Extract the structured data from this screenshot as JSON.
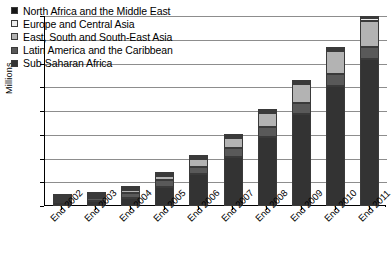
{
  "chart_data": {
    "type": "bar",
    "stacked": true,
    "title": "",
    "xlabel": "",
    "ylabel": "Millions",
    "ylim": [
      0.0,
      8.0
    ],
    "ytick_labels": [
      "0.0",
      "1.0",
      "2.0",
      "3.0",
      "4.0",
      "5.0",
      "6.0",
      "7.0",
      "8.0"
    ],
    "ytick_values": [
      0.0,
      1.0,
      2.0,
      3.0,
      4.0,
      5.0,
      6.0,
      7.0,
      8.0
    ],
    "grid": "horizontal",
    "legend_position": "upper-left-inside",
    "categories": [
      "End 2002",
      "End 2003",
      "End 2004",
      "End 2005",
      "End 2006",
      "End 2007",
      "End 2008",
      "End 2009",
      "End 2010",
      "End 2011"
    ],
    "series": [
      {
        "name": "Sub-Saharan Africa",
        "color": "#333333",
        "values": [
          0.15,
          0.2,
          0.32,
          0.81,
          1.34,
          2.07,
          2.92,
          3.89,
          5.06,
          6.17
        ]
      },
      {
        "name": "Latin America and the Caribbean",
        "color": "#595959",
        "values": [
          0.12,
          0.14,
          0.22,
          0.28,
          0.32,
          0.37,
          0.42,
          0.46,
          0.5,
          0.54
        ]
      },
      {
        "name": "East, South and South-East Asia",
        "color": "#b3b3b3",
        "values": [
          0.04,
          0.06,
          0.13,
          0.18,
          0.31,
          0.43,
          0.59,
          0.78,
          0.95,
          1.08
        ]
      },
      {
        "name": "Europe and Central Asia",
        "color": "#ededed",
        "values": [
          0.01,
          0.01,
          0.02,
          0.03,
          0.04,
          0.05,
          0.07,
          0.08,
          0.09,
          0.11
        ]
      },
      {
        "name": "North Africa and the Middle East",
        "color": "#161616",
        "values": [
          0.005,
          0.005,
          0.01,
          0.01,
          0.02,
          0.02,
          0.03,
          0.04,
          0.05,
          0.06
        ]
      }
    ],
    "totals": [
      0.33,
      0.42,
      0.7,
      1.31,
      2.03,
      2.94,
      4.03,
      5.25,
      6.65,
      7.96
    ]
  },
  "legend": {
    "items": [
      {
        "label": "North Africa and the Middle East",
        "color": "#161616"
      },
      {
        "label": "Europe and Central Asia",
        "color": "#ededed"
      },
      {
        "label": "East, South and South-East Asia",
        "color": "#b3b3b3"
      },
      {
        "label": "Latin America and the Caribbean",
        "color": "#595959"
      },
      {
        "label": "Sub-Saharan Africa",
        "color": "#333333"
      }
    ]
  }
}
